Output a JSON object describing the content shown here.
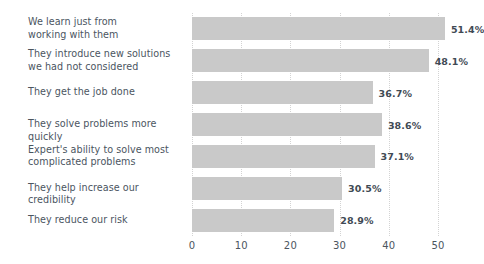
{
  "chart_data": {
    "type": "bar",
    "orientation": "horizontal",
    "title": "",
    "subtitle": "",
    "xlabel": "",
    "ylabel": "",
    "xlim": [
      0,
      50
    ],
    "grid": "vertical-dotted",
    "legend": "none",
    "bar_color": "#c9c9c9",
    "label_color": "#4b555f",
    "value_label_color": "#3f4a54",
    "gridline_color": "#d3d3d3",
    "xticks": [
      0,
      10,
      20,
      30,
      40,
      50
    ],
    "xtick_labels": [
      "0",
      "10",
      "20",
      "30",
      "40",
      "50"
    ],
    "categories": [
      "We learn just from working with them",
      "They introduce new solutions we had not considered",
      "They get the job done",
      "They solve problems more quickly",
      "Expert's ability to solve most complicated problems",
      "They help increase our credibility",
      "They reduce our risk"
    ],
    "category_lines": [
      [
        "We learn just from",
        "working with them"
      ],
      [
        "They introduce new solutions",
        "we had not considered"
      ],
      [
        "They get the job done"
      ],
      [
        "They solve problems more quickly"
      ],
      [
        "Expert's ability to solve most",
        "complicated problems"
      ],
      [
        "They help increase our credibility"
      ],
      [
        "They reduce our risk"
      ]
    ],
    "values": [
      51.4,
      48.1,
      36.7,
      38.6,
      37.1,
      30.5,
      28.9
    ],
    "value_labels": [
      "51.4%",
      "48.1%",
      "36.7%",
      "38.6%",
      "37.1%",
      "30.5%",
      "28.9%"
    ]
  }
}
